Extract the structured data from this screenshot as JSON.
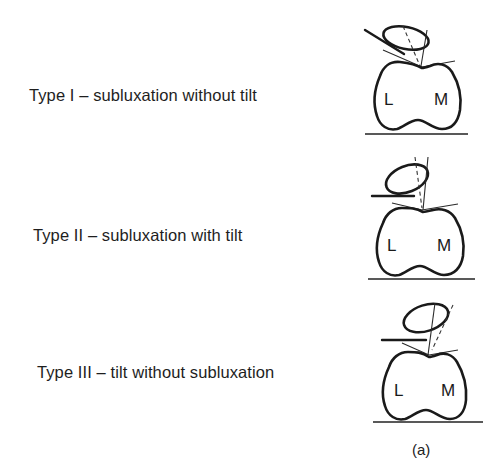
{
  "figure": {
    "caption": "(a)",
    "condyle_labels": {
      "lateral": "L",
      "medial": "M"
    }
  },
  "types": [
    {
      "label": "Type I – subluxation without tilt"
    },
    {
      "label": "Type II – subluxation with tilt"
    },
    {
      "label": "Type III – tilt without subluxation"
    }
  ]
}
